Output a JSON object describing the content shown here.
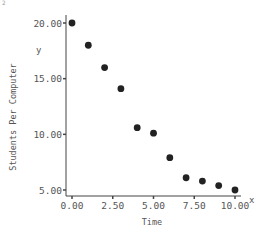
{
  "chart_data": {
    "type": "scatter",
    "title": "",
    "xlabel": "Time",
    "ylabel": "Students Per Computer",
    "x_axis_letter": "x",
    "y_axis_letter": "y",
    "corner_mark": "2",
    "xlim": [
      0,
      10
    ],
    "ylim": [
      5,
      20
    ],
    "x_ticks": [
      0,
      2.5,
      5,
      7.5,
      10
    ],
    "x_tick_labels": [
      "0.00",
      "2.50",
      "5.00",
      "7.50",
      "10.00"
    ],
    "y_ticks": [
      5,
      10,
      15,
      20
    ],
    "y_tick_labels": [
      "5.00",
      "10.00",
      "15.00",
      "20.00"
    ],
    "grid": false,
    "legend": null,
    "series": [
      {
        "name": "Students Per Computer",
        "color": "#222222",
        "x": [
          0,
          1,
          2,
          3,
          4,
          5,
          6,
          7,
          8,
          9,
          10
        ],
        "y": [
          20.0,
          18.0,
          16.0,
          14.1,
          10.6,
          10.1,
          7.9,
          6.1,
          5.8,
          5.4,
          5.0
        ]
      }
    ]
  },
  "layout": {
    "plot_left_px": 72,
    "plot_right_px": 235,
    "plot_top_px": 23,
    "plot_bottom_px": 190,
    "y_axis_x_px": 66,
    "x_axis_y_px": 196,
    "x_axis_end_px": 241,
    "axis_color": "#444444",
    "marker_color": "#222222"
  }
}
